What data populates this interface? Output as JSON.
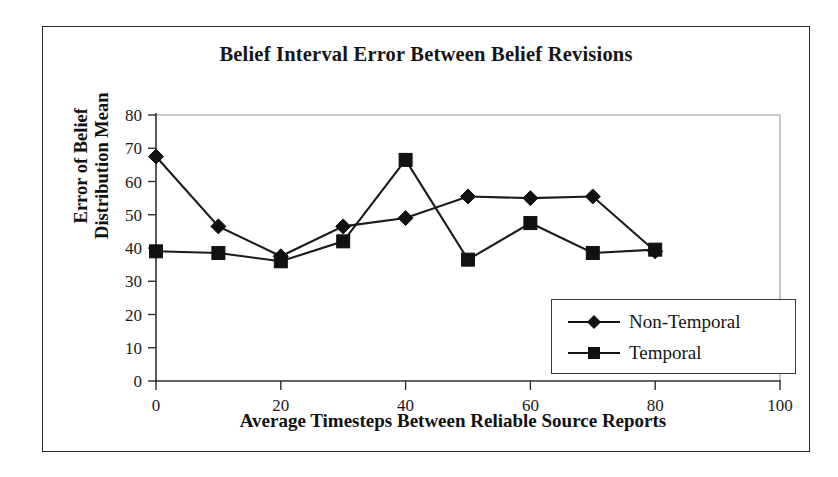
{
  "chart_data": {
    "type": "line",
    "title": "Belief Interval Error Between Belief Revisions",
    "xlabel": "Average Timesteps Between Reliable Source Reports",
    "ylabel": "Error of Belief Distribution Mean",
    "ylabel_line1": "Error of Belief",
    "ylabel_line2": "Distribution Mean",
    "x": [
      0,
      10,
      20,
      30,
      40,
      50,
      60,
      70,
      80
    ],
    "xlim": [
      0,
      100
    ],
    "ylim": [
      0,
      80
    ],
    "xticks": [
      0,
      20,
      40,
      60,
      80,
      100
    ],
    "yticks": [
      0,
      10,
      20,
      30,
      40,
      50,
      60,
      70,
      80
    ],
    "xtick_labels": [
      "0",
      "20",
      "40",
      "60",
      "80",
      "100"
    ],
    "ytick_labels": [
      "0",
      "10",
      "20",
      "30",
      "40",
      "50",
      "60",
      "70",
      "80"
    ],
    "grid": false,
    "legend_position": "lower-right-inside",
    "series": [
      {
        "name": "Non-Temporal",
        "marker": "diamond",
        "color": "#111111",
        "values": [
          67.5,
          46.5,
          37.5,
          46.5,
          49.0,
          55.5,
          55.0,
          55.5,
          39.0
        ]
      },
      {
        "name": "Temporal",
        "marker": "square",
        "color": "#111111",
        "values": [
          39.0,
          38.5,
          36.0,
          42.0,
          66.5,
          36.5,
          47.5,
          38.5,
          39.5
        ]
      }
    ]
  },
  "legend": {
    "items": [
      {
        "label": "Non-Temporal",
        "marker": "diamond"
      },
      {
        "label": "Temporal",
        "marker": "square"
      }
    ]
  }
}
